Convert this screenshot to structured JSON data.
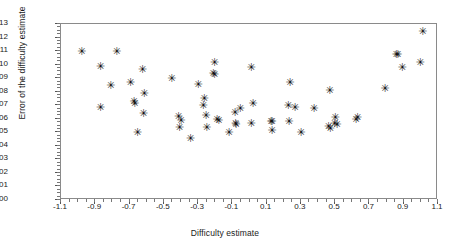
{
  "chart_data": {
    "type": "scatter",
    "title": "",
    "xlabel": "Difficulty estimate",
    "ylabel": "Error of the difficulty estimate",
    "xlim": [
      -1.1,
      1.1
    ],
    "ylim": [
      0.0,
      0.13
    ],
    "grid": false,
    "legend": null,
    "marker": "asterisk",
    "marker_color": "#111111",
    "xticks": [
      "-1.1",
      "-0.9",
      "-0.7",
      "-0.5",
      "-0.3",
      "-0.1",
      "0.1",
      "0.3",
      "0.5",
      "0.7",
      "0.9",
      "1.1"
    ],
    "xtick_values": [
      -1.1,
      -0.9,
      -0.7,
      -0.5,
      -0.3,
      -0.1,
      0.1,
      0.3,
      0.5,
      0.7,
      0.9,
      1.1
    ],
    "xtick_minor_step": 0.05,
    "yticks": [
      "0.00",
      "0.01",
      "0.02",
      "0.03",
      "0.04",
      "0.05",
      "0.06",
      "0.07",
      "0.08",
      "0.09",
      "0.10",
      "0.11",
      "0.12",
      "0.13"
    ],
    "ytick_values": [
      0.0,
      0.01,
      0.02,
      0.03,
      0.04,
      0.05,
      0.06,
      0.07,
      0.08,
      0.09,
      0.1,
      0.11,
      0.12,
      0.13
    ],
    "ytick_minor_step": 0.0025,
    "points": [
      {
        "x": -0.98,
        "y": 0.11
      },
      {
        "x": -0.87,
        "y": 0.099
      },
      {
        "x": -0.87,
        "y": 0.069
      },
      {
        "x": -0.81,
        "y": 0.085
      },
      {
        "x": -0.775,
        "y": 0.11
      },
      {
        "x": -0.695,
        "y": 0.087
      },
      {
        "x": -0.675,
        "y": 0.073
      },
      {
        "x": -0.67,
        "y": 0.072
      },
      {
        "x": -0.655,
        "y": 0.05
      },
      {
        "x": -0.625,
        "y": 0.097
      },
      {
        "x": -0.615,
        "y": 0.079
      },
      {
        "x": -0.62,
        "y": 0.064
      },
      {
        "x": -0.455,
        "y": 0.09
      },
      {
        "x": -0.415,
        "y": 0.062
      },
      {
        "x": -0.4,
        "y": 0.059
      },
      {
        "x": -0.41,
        "y": 0.054
      },
      {
        "x": -0.345,
        "y": 0.046
      },
      {
        "x": -0.3,
        "y": 0.086
      },
      {
        "x": -0.265,
        "y": 0.075
      },
      {
        "x": -0.27,
        "y": 0.07
      },
      {
        "x": -0.255,
        "y": 0.063
      },
      {
        "x": -0.25,
        "y": 0.054
      },
      {
        "x": -0.205,
        "y": 0.102
      },
      {
        "x": -0.212,
        "y": 0.094
      },
      {
        "x": -0.205,
        "y": 0.093
      },
      {
        "x": -0.19,
        "y": 0.06
      },
      {
        "x": -0.18,
        "y": 0.059
      },
      {
        "x": -0.12,
        "y": 0.05
      },
      {
        "x": -0.085,
        "y": 0.065
      },
      {
        "x": -0.082,
        "y": 0.057
      },
      {
        "x": -0.08,
        "y": 0.056
      },
      {
        "x": -0.055,
        "y": 0.068
      },
      {
        "x": 0.01,
        "y": 0.098
      },
      {
        "x": 0.02,
        "y": 0.072
      },
      {
        "x": 0.01,
        "y": 0.057
      },
      {
        "x": 0.125,
        "y": 0.058
      },
      {
        "x": 0.13,
        "y": 0.058
      },
      {
        "x": 0.13,
        "y": 0.052
      },
      {
        "x": 0.235,
        "y": 0.087
      },
      {
        "x": 0.225,
        "y": 0.07
      },
      {
        "x": 0.265,
        "y": 0.069
      },
      {
        "x": 0.23,
        "y": 0.058
      },
      {
        "x": 0.3,
        "y": 0.05
      },
      {
        "x": 0.375,
        "y": 0.068
      },
      {
        "x": 0.468,
        "y": 0.081
      },
      {
        "x": 0.46,
        "y": 0.055
      },
      {
        "x": 0.47,
        "y": 0.053
      },
      {
        "x": 0.5,
        "y": 0.061
      },
      {
        "x": 0.495,
        "y": 0.057
      },
      {
        "x": 0.51,
        "y": 0.056
      },
      {
        "x": 0.62,
        "y": 0.06
      },
      {
        "x": 0.63,
        "y": 0.061
      },
      {
        "x": 0.79,
        "y": 0.083
      },
      {
        "x": 0.855,
        "y": 0.108
      },
      {
        "x": 0.865,
        "y": 0.108
      },
      {
        "x": 0.89,
        "y": 0.098
      },
      {
        "x": 1.01,
        "y": 0.125
      },
      {
        "x": 0.995,
        "y": 0.102
      }
    ]
  },
  "marker_glyph": "✳"
}
